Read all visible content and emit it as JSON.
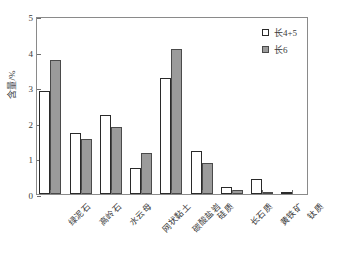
{
  "chart_data": {
    "type": "bar",
    "title": "",
    "subtitle": "",
    "xlabel": "",
    "ylabel": "含量/%",
    "ylim": [
      0,
      5
    ],
    "yticks": [
      0,
      1,
      2,
      3,
      4,
      5
    ],
    "ytick_labels": [
      "0",
      "1",
      "2",
      "3",
      "4",
      "5"
    ],
    "grid": false,
    "legend_position": "top-right",
    "categories": [
      "绿泥石",
      "高岭石",
      "水云母",
      "网状黏土",
      "碳酸盐岩",
      "硅质",
      "长石质",
      "黄铁矿",
      "钛质"
    ],
    "series": [
      {
        "name": "长4+5",
        "color": "#ffffff",
        "edge_color": "#2a2a2a",
        "values": [
          2.9,
          1.7,
          2.21,
          0.73,
          3.25,
          1.22,
          0.21,
          0.43,
          0.07
        ]
      },
      {
        "name": "长6",
        "color": "#9b9b9b",
        "edge_color": "#4a4a4a",
        "values": [
          3.77,
          1.55,
          1.88,
          1.15,
          4.08,
          0.86,
          0.12,
          0.07,
          0.0
        ]
      }
    ]
  }
}
